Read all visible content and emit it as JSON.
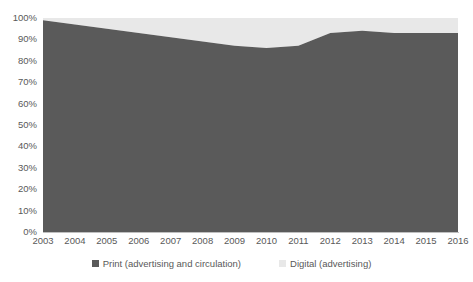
{
  "chart_data": {
    "type": "area",
    "stacked": true,
    "normalized": true,
    "title": "",
    "subtitle": "",
    "xlabel": "",
    "ylabel": "",
    "categories": [
      "2003",
      "2004",
      "2005",
      "2006",
      "2007",
      "2008",
      "2009",
      "2010",
      "2011",
      "2012",
      "2013",
      "2014",
      "2015",
      "2016"
    ],
    "x_tick_labels": [
      "2003",
      "2004",
      "2005",
      "2006",
      "2007",
      "2008",
      "2009",
      "2010",
      "2011",
      "2012",
      "2013",
      "2014",
      "2015",
      "2016"
    ],
    "y_tick_labels": [
      "100%",
      "90%",
      "80%",
      "70%",
      "60%",
      "50%",
      "40%",
      "30%",
      "20%",
      "10%",
      "0%"
    ],
    "y_tick_values": [
      100,
      90,
      80,
      70,
      60,
      50,
      40,
      30,
      20,
      10,
      0
    ],
    "ylim": [
      0,
      100
    ],
    "grid": false,
    "legend_position": "bottom",
    "series": [
      {
        "name": "Print (advertising and circulation)",
        "color": "#5A5A5A",
        "values": [
          99,
          97,
          95,
          93,
          91,
          89,
          87,
          86,
          87,
          93,
          94,
          93,
          93,
          93
        ]
      },
      {
        "name": "Digital (advertising)",
        "color": "#E8E8E8",
        "values": [
          1,
          3,
          5,
          7,
          9,
          11,
          13,
          14,
          13,
          7,
          6,
          7,
          7,
          7
        ]
      }
    ]
  },
  "legend": {
    "items": [
      {
        "label": "Print (advertising and circulation)",
        "color": "#5A5A5A",
        "swatch_name": "legend-swatch-print"
      },
      {
        "label": "Digital (advertising)",
        "color": "#E8E8E8",
        "swatch_name": "legend-swatch-digital"
      }
    ]
  },
  "colors": {
    "print": "#5A5A5A",
    "digital": "#E8E8E8",
    "axis_text": "#595959",
    "axis_line": "#BFBFBF",
    "background": "#FFFFFF"
  }
}
